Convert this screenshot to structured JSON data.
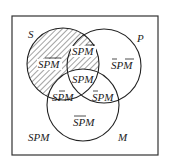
{
  "diagram": {
    "type": "venn",
    "sets": [
      {
        "name": "S",
        "label": "S",
        "cx": 63,
        "cy": 64,
        "r": 36,
        "shaded": true
      },
      {
        "name": "P",
        "label": "P",
        "cx": 104,
        "cy": 66,
        "r": 37,
        "shaded": false
      },
      {
        "name": "M",
        "label": "M",
        "cx": 83,
        "cy": 105,
        "r": 36,
        "shaded": false
      }
    ],
    "regions": [
      {
        "id": "s-only",
        "text": "SPM",
        "overline": "PM",
        "shaded": true
      },
      {
        "id": "s-p-only",
        "text": "SPM",
        "overline": "M",
        "shaded": true
      },
      {
        "id": "p-only",
        "text": "SPM",
        "overline": "S,M",
        "shaded": false
      },
      {
        "id": "s-p-m",
        "text": "SPM",
        "overline": "",
        "shaded": false
      },
      {
        "id": "s-m-only",
        "text": "SPM",
        "overline": "P",
        "shaded": false
      },
      {
        "id": "p-m-only",
        "text": "SPM",
        "overline": "S",
        "shaded": false
      },
      {
        "id": "m-only",
        "text": "SPM",
        "overline": "SP",
        "shaded": false
      },
      {
        "id": "outside",
        "text": "SPM",
        "overline": "",
        "shaded": false
      }
    ],
    "labels": {
      "s": "S",
      "p": "P",
      "m": "M",
      "s_only": "SPM",
      "s_p_only": "SPM",
      "p_only": "SPM",
      "center": "SPM",
      "s_m_only": "SPM",
      "p_m_only": "SPM",
      "m_only": "SPM",
      "outside": "SPM"
    },
    "colors": {
      "stroke": "#222222",
      "hatch": "#333333",
      "background": "#ffffff"
    }
  }
}
